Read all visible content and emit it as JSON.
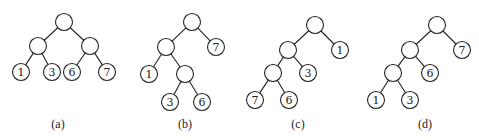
{
  "node_radius": 8.5,
  "trees": [
    {
      "caption": "(a)",
      "caption_pos": [
        58,
        128
      ],
      "nodes": [
        {
          "id": "r",
          "x": 64,
          "y": 22,
          "label": ""
        },
        {
          "id": "L",
          "x": 38,
          "y": 46,
          "label": ""
        },
        {
          "id": "R",
          "x": 90,
          "y": 46,
          "label": ""
        },
        {
          "id": "n1",
          "x": 21,
          "y": 72,
          "label": "1"
        },
        {
          "id": "n3",
          "x": 52,
          "y": 72,
          "label": "3"
        },
        {
          "id": "n6",
          "x": 72,
          "y": 72,
          "label": "6"
        },
        {
          "id": "n7",
          "x": 107,
          "y": 72,
          "label": "7"
        }
      ],
      "edges": [
        [
          "r",
          "L"
        ],
        [
          "r",
          "R"
        ],
        [
          "L",
          "n1"
        ],
        [
          "L",
          "n3"
        ],
        [
          "R",
          "n6"
        ],
        [
          "R",
          "n7"
        ]
      ]
    },
    {
      "caption": "(b)",
      "caption_pos": [
        185,
        128
      ],
      "nodes": [
        {
          "id": "r",
          "x": 192,
          "y": 22,
          "label": ""
        },
        {
          "id": "L",
          "x": 166,
          "y": 47,
          "label": ""
        },
        {
          "id": "n7",
          "x": 216,
          "y": 47,
          "label": "7"
        },
        {
          "id": "n1",
          "x": 149,
          "y": 74,
          "label": "1"
        },
        {
          "id": "M",
          "x": 185,
          "y": 74,
          "label": ""
        },
        {
          "id": "n3",
          "x": 170,
          "y": 102,
          "label": "3"
        },
        {
          "id": "n6",
          "x": 202,
          "y": 102,
          "label": "6"
        }
      ],
      "edges": [
        [
          "r",
          "L"
        ],
        [
          "r",
          "n7"
        ],
        [
          "L",
          "n1"
        ],
        [
          "L",
          "M"
        ],
        [
          "M",
          "n3"
        ],
        [
          "M",
          "n6"
        ]
      ]
    },
    {
      "caption": "(c)",
      "caption_pos": [
        298,
        128
      ],
      "nodes": [
        {
          "id": "r",
          "x": 315,
          "y": 25,
          "label": ""
        },
        {
          "id": "L",
          "x": 288,
          "y": 50,
          "label": ""
        },
        {
          "id": "n1",
          "x": 340,
          "y": 50,
          "label": "1"
        },
        {
          "id": "M",
          "x": 273,
          "y": 73,
          "label": ""
        },
        {
          "id": "n3",
          "x": 308,
          "y": 73,
          "label": "3"
        },
        {
          "id": "n7",
          "x": 255,
          "y": 100,
          "label": "7"
        },
        {
          "id": "n6",
          "x": 289,
          "y": 100,
          "label": "6"
        }
      ],
      "edges": [
        [
          "r",
          "L"
        ],
        [
          "r",
          "n1"
        ],
        [
          "L",
          "M"
        ],
        [
          "L",
          "n3"
        ],
        [
          "M",
          "n7"
        ],
        [
          "M",
          "n6"
        ]
      ]
    },
    {
      "caption": "(d)",
      "caption_pos": [
        425,
        128
      ],
      "nodes": [
        {
          "id": "r",
          "x": 437,
          "y": 25,
          "label": ""
        },
        {
          "id": "L",
          "x": 410,
          "y": 50,
          "label": ""
        },
        {
          "id": "n7",
          "x": 462,
          "y": 50,
          "label": "7"
        },
        {
          "id": "M",
          "x": 393,
          "y": 73,
          "label": ""
        },
        {
          "id": "n6",
          "x": 430,
          "y": 73,
          "label": "6"
        },
        {
          "id": "n1",
          "x": 376,
          "y": 100,
          "label": "1"
        },
        {
          "id": "n3",
          "x": 410,
          "y": 100,
          "label": "3"
        }
      ],
      "edges": [
        [
          "r",
          "L"
        ],
        [
          "r",
          "n7"
        ],
        [
          "L",
          "M"
        ],
        [
          "L",
          "n6"
        ],
        [
          "M",
          "n1"
        ],
        [
          "M",
          "n3"
        ]
      ]
    }
  ]
}
